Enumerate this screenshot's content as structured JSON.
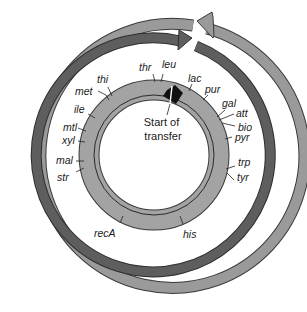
{
  "diagram": {
    "title": "",
    "center_label": [
      "Start of",
      "transfer"
    ],
    "colors": {
      "outer_ring": "#9a9a9a",
      "middle_ring": "#5e5e5e",
      "chromosome_ring": "#a3a3a3",
      "ring_stroke": "#3a3a3a",
      "origin_marker": "#111111",
      "background": "#ffffff"
    },
    "genes": [
      {
        "name": "thr",
        "x": 139,
        "y": 41
      },
      {
        "name": "leu",
        "x": 164,
        "y": 38
      },
      {
        "name": "lac",
        "x": 193,
        "y": 83
      },
      {
        "name": "pur",
        "x": 207,
        "y": 97
      },
      {
        "name": "gal",
        "x": 225,
        "y": 105
      },
      {
        "name": "att",
        "x": 239,
        "y": 119
      },
      {
        "name": "bio",
        "x": 239,
        "y": 132
      },
      {
        "name": "pyr",
        "x": 236,
        "y": 146
      },
      {
        "name": "trp",
        "x": 238,
        "y": 171
      },
      {
        "name": "tyr",
        "x": 238,
        "y": 185
      },
      {
        "name": "his",
        "x": 183,
        "y": 242
      },
      {
        "name": "recA",
        "x": 95,
        "y": 237
      },
      {
        "name": "str",
        "x": 58,
        "y": 180
      },
      {
        "name": "mal",
        "x": 58,
        "y": 164
      },
      {
        "name": "xyl",
        "x": 63,
        "y": 144
      },
      {
        "name": "mtl",
        "x": 62,
        "y": 131
      },
      {
        "name": "ile",
        "x": 73,
        "y": 112
      },
      {
        "name": "met",
        "x": 75,
        "y": 94
      },
      {
        "name": "thi",
        "x": 95,
        "y": 82
      }
    ]
  }
}
